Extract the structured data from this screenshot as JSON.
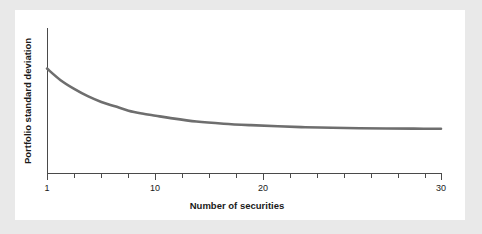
{
  "figure": {
    "background_color": "#e9e9e9",
    "card_color": "#ffffff"
  },
  "chart_data": {
    "type": "line",
    "title": "",
    "subtitle": "",
    "xlabel": "Number of securities",
    "ylabel": "Portfolio standard deviation",
    "xlim": [
      1,
      30
    ],
    "ylim": [
      0,
      100
    ],
    "grid": false,
    "legend": false,
    "legend_position": "none",
    "series_color": "#6e6e6e",
    "x_tick_labels": [
      "1",
      "10",
      "20",
      "30"
    ],
    "x_tick_label_values": [
      1,
      10,
      20,
      30
    ],
    "x_minor_ticks": [
      1,
      3,
      5,
      7,
      8,
      10,
      12,
      14,
      16,
      18,
      20,
      22,
      24,
      26,
      28,
      30
    ],
    "y_tick_labels": [],
    "annotations": [],
    "x": [
      1,
      2,
      3,
      4,
      5,
      6,
      7,
      8,
      9,
      10,
      12,
      14,
      16,
      18,
      20,
      22,
      24,
      26,
      28,
      30
    ],
    "values": [
      72,
      64,
      58,
      53,
      49,
      46,
      43,
      41,
      39.5,
      38,
      35.5,
      34,
      33,
      32.2,
      31.6,
      31.2,
      30.9,
      30.7,
      30.6,
      30.5
    ],
    "series": [
      {
        "name": "Portfolio standard deviation",
        "color": "#6e6e6e",
        "values": [
          72,
          64,
          58,
          53,
          49,
          46,
          43,
          41,
          39.5,
          38,
          35.5,
          34,
          33,
          32.2,
          31.6,
          31.2,
          30.9,
          30.7,
          30.6,
          30.5
        ]
      }
    ],
    "note": "Diversification curve: portfolio risk declines and flattens toward systematic risk level as securities are added."
  },
  "labels": {
    "x_axis_title": "Number of securities",
    "y_axis_title": "Portfolio standard deviation",
    "tick_1": "1",
    "tick_10": "10",
    "tick_20": "20",
    "tick_30": "30"
  }
}
